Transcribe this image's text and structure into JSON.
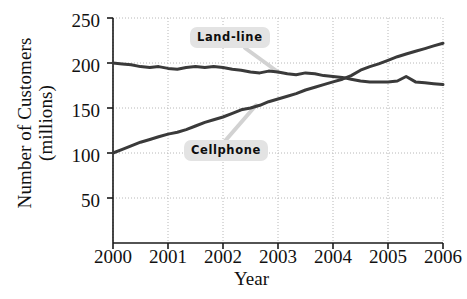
{
  "chart_data": {
    "type": "line",
    "title": "",
    "xlabel": "Year",
    "ylabel_line1": "Number of Customers",
    "ylabel_line2": "(millions)",
    "xlim": [
      2000,
      2006
    ],
    "ylim": [
      0,
      250
    ],
    "xticks": [
      "2000",
      "2001",
      "2002",
      "2003",
      "2004",
      "2005",
      "2006"
    ],
    "yticks": [
      "50",
      "100",
      "150",
      "200",
      "250"
    ],
    "grid": true,
    "grid_style": "dotted",
    "legend_position": "inline-callouts",
    "line_color": "#3a3a3a",
    "callout_bg": "#e3e3e3",
    "series": [
      {
        "name": "Land-line",
        "label": "Land-line",
        "x": [
          2000.0,
          2000.17,
          2000.33,
          2000.5,
          2000.67,
          2000.83,
          2001.0,
          2001.17,
          2001.33,
          2001.5,
          2001.67,
          2001.83,
          2002.0,
          2002.17,
          2002.33,
          2002.5,
          2002.67,
          2002.83,
          2003.0,
          2003.17,
          2003.33,
          2003.5,
          2003.67,
          2003.83,
          2004.0,
          2004.17,
          2004.33,
          2004.5,
          2004.67,
          2004.83,
          2005.0,
          2005.17,
          2005.33,
          2005.5,
          2005.67,
          2005.83,
          2006.0
        ],
        "values": [
          200,
          199,
          198,
          196,
          195,
          196,
          194,
          193,
          195,
          196,
          195,
          196,
          195,
          193,
          192,
          190,
          189,
          191,
          190,
          188,
          187,
          189,
          188,
          186,
          185,
          184,
          182,
          180,
          179,
          179,
          179,
          180,
          185,
          179,
          178,
          177,
          176
        ]
      },
      {
        "name": "Cellphone",
        "label": "Cellphone",
        "x": [
          2000.0,
          2000.17,
          2000.33,
          2000.5,
          2000.67,
          2000.83,
          2001.0,
          2001.17,
          2001.33,
          2001.5,
          2001.67,
          2001.83,
          2002.0,
          2002.17,
          2002.33,
          2002.5,
          2002.67,
          2002.83,
          2003.0,
          2003.17,
          2003.33,
          2003.5,
          2003.67,
          2003.83,
          2004.0,
          2004.17,
          2004.33,
          2004.5,
          2004.67,
          2004.83,
          2005.0,
          2005.17,
          2005.33,
          2005.5,
          2005.67,
          2005.83,
          2006.0
        ],
        "values": [
          100,
          104,
          108,
          112,
          115,
          118,
          121,
          123,
          126,
          130,
          134,
          137,
          140,
          144,
          148,
          150,
          153,
          157,
          160,
          163,
          166,
          170,
          173,
          176,
          179,
          182,
          186,
          192,
          196,
          199,
          203,
          207,
          210,
          213,
          216,
          219,
          222
        ]
      }
    ],
    "annotations": [
      {
        "name": "land-line-callout",
        "text": "Land-line",
        "points_to_series": "Land-line",
        "points_to_x": 2003.0
      },
      {
        "name": "cellphone-callout",
        "text": "Cellphone",
        "points_to_series": "Cellphone",
        "points_to_x": 2002.6
      }
    ]
  }
}
